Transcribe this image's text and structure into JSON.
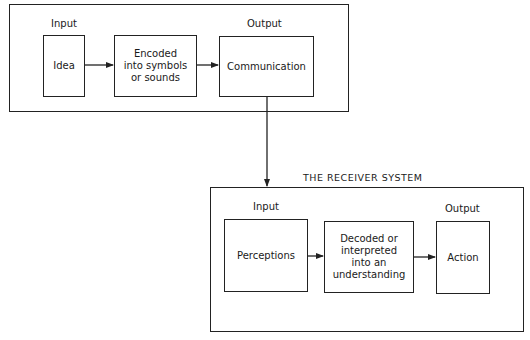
{
  "sender_system": {
    "input_label": "Input",
    "output_label": "Output",
    "boxes": [
      {
        "label": "Idea"
      },
      {
        "label": "Encoded\ninto symbols\nor sounds"
      },
      {
        "label": "Communication"
      }
    ]
  },
  "receiver_system": {
    "title": "THE RECEIVER SYSTEM",
    "input_label": "Input",
    "output_label": "Output",
    "boxes": [
      {
        "label": "Perceptions"
      },
      {
        "label": "Decoded or\ninterpreted\ninto an\nunderstanding"
      },
      {
        "label": "Action"
      }
    ]
  },
  "colors": {
    "line": "#222222",
    "background": "#ffffff"
  }
}
